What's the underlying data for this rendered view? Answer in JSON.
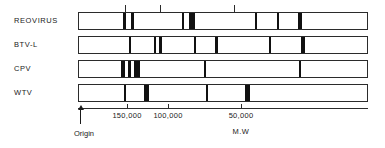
{
  "figure": {
    "caption_axis_title": "M.W",
    "origin_label": "Origin"
  },
  "geometry": {
    "bar_left": 78,
    "bar_right": 368,
    "bar_height": 18,
    "label_x": 14,
    "lane_tops": [
      12,
      36,
      60,
      84
    ],
    "axis_y": 108,
    "tick_label_y": 112,
    "axis_title_y": 128,
    "origin_x": 80,
    "origin_top": 110,
    "origin_label_y": 130
  },
  "chart_data": {
    "type": "table",
    "title": "",
    "subtitle": "",
    "xlabel": "M.W",
    "ylabel": "",
    "xlim": [
      200000,
      20000
    ],
    "grid": false,
    "legend_position": "none",
    "annotations": [
      "Origin",
      "M.W"
    ],
    "axis": {
      "tick_labels": [
        "150,000",
        "100,000",
        "50,000"
      ],
      "tick_values": [
        150000,
        100000,
        50000
      ],
      "tick_x_px": [
        127,
        168,
        241
      ]
    },
    "top_marker_ticks_px": [
      125,
      160,
      234
    ],
    "lanes": [
      {
        "name": "REOVIRUS",
        "bands_px": [
          {
            "x": 122,
            "w": 3
          },
          {
            "x": 130,
            "w": 3
          },
          {
            "x": 181,
            "w": 2
          },
          {
            "x": 188,
            "w": 6
          },
          {
            "x": 254,
            "w": 2
          },
          {
            "x": 276,
            "w": 2
          },
          {
            "x": 297,
            "w": 4
          }
        ]
      },
      {
        "name": "BTV-L",
        "bands_px": [
          {
            "x": 128,
            "w": 2
          },
          {
            "x": 153,
            "w": 2
          },
          {
            "x": 158,
            "w": 3
          },
          {
            "x": 193,
            "w": 2
          },
          {
            "x": 214,
            "w": 3
          },
          {
            "x": 268,
            "w": 2
          },
          {
            "x": 300,
            "w": 4
          }
        ]
      },
      {
        "name": "CPV",
        "bands_px": [
          {
            "x": 120,
            "w": 4
          },
          {
            "x": 127,
            "w": 3
          },
          {
            "x": 133,
            "w": 6
          },
          {
            "x": 203,
            "w": 2
          },
          {
            "x": 298,
            "w": 2
          }
        ]
      },
      {
        "name": "WTV",
        "bands_px": [
          {
            "x": 123,
            "w": 2
          },
          {
            "x": 143,
            "w": 5
          },
          {
            "x": 205,
            "w": 2
          },
          {
            "x": 244,
            "w": 5
          }
        ]
      }
    ]
  }
}
